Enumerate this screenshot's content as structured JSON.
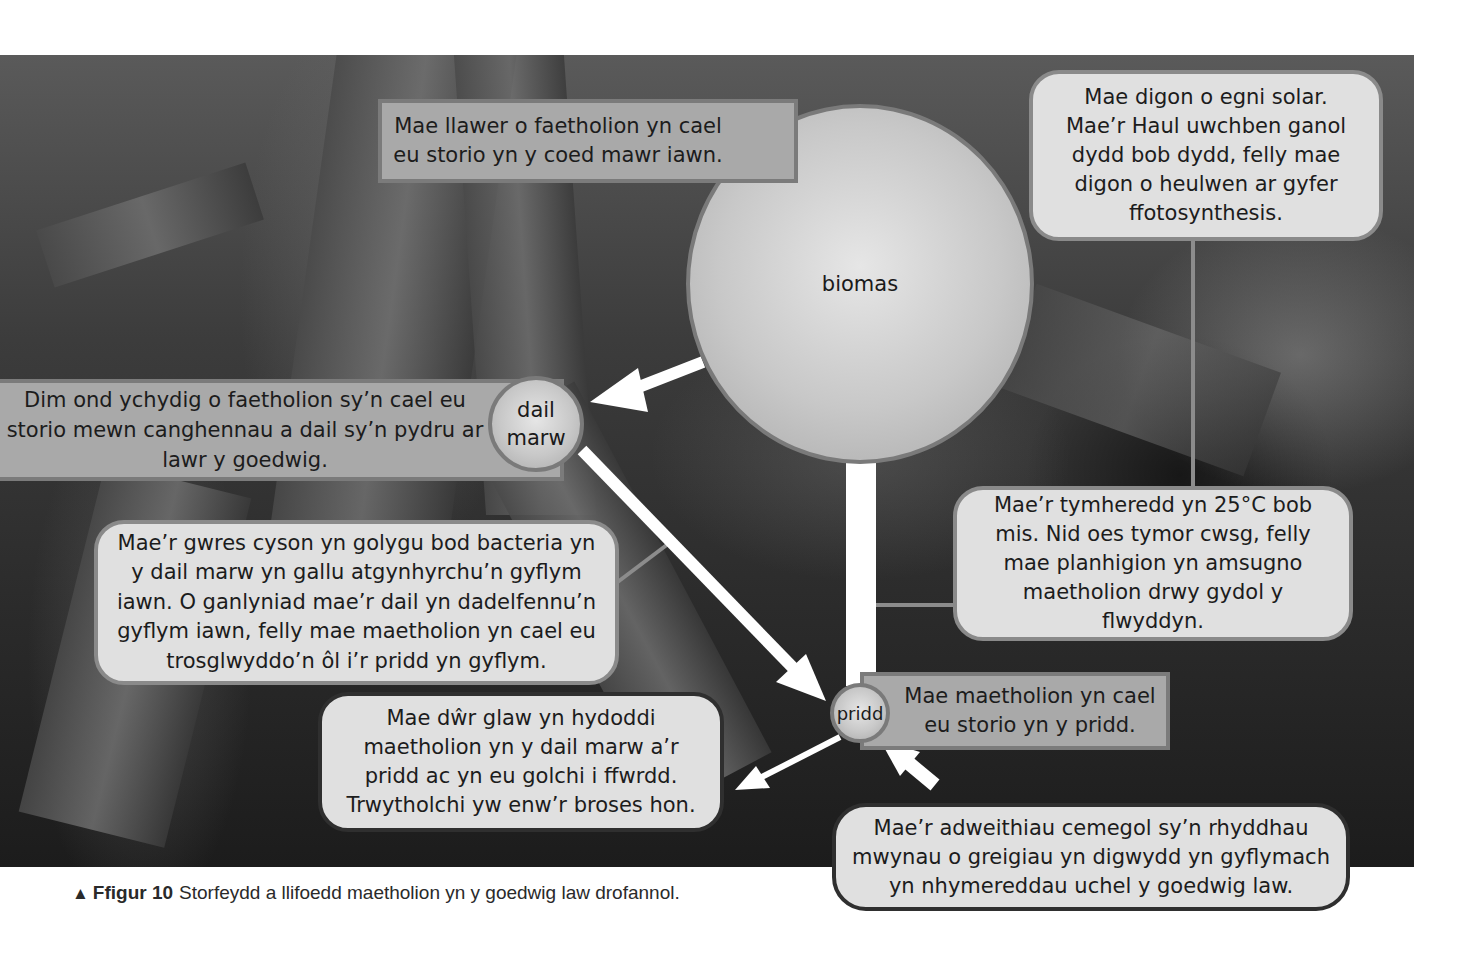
{
  "figure": {
    "caption_marker": "▲",
    "caption_label": "Ffigur 10",
    "caption_text": "Storfeydd a llifoedd maetholion yn y goedwig law drofannol."
  },
  "nodes": {
    "biomass": "biomas",
    "litter": "dail\nmarw",
    "soil": "pridd"
  },
  "boxes": {
    "biomass_store": "Mae llawer o faetholion yn cael\neu storio yn y coed mawr iawn.",
    "solar_energy": "Mae digon o egni solar.\nMae’r Haul uwchben ganol\ndydd bob dydd, felly mae\ndigon o heulwen ar gyfer\nffotosynthesis.",
    "litter_store": "Dim ond ychydig o faetholion sy’n cael eu\nstorio mewn canghennau a dail sy’n pydru ar\nlawr y goedwig.",
    "decomposition": "Mae’r gwres cyson yn golygu bod bacteria yn\ny dail marw yn gallu atgynhyrchu’n gyflym\niawn. O ganlyniad mae’r dail yn dadelfennu’n\ngyflym iawn, felly mae maetholion yn cael eu\ntrosglwyddo’n ôl i’r pridd yn gyflym.",
    "temperature": "Mae’r tymheredd yn 25°C bob\nmis. Nid oes tymor cwsg, felly\nmae planhigion yn amsugno\nmaetholion drwy gydol y\nflwyddyn.",
    "soil_store": "Mae maetholion yn cael\neu storio yn y pridd.",
    "leaching": "Mae dŵr glaw yn hydoddi\nmaetholion yn y dail marw a’r\npridd ac yn eu golchi i ffwrdd.\nTrwytholchi yw enw’r broses hon.",
    "weathering": "Mae’r adweithiau cemegol sy’n rhyddhau\nmwynau o greigiau yn digwydd yn gyflymach\nyn nhymereddau uchel y goedwig law."
  },
  "flows": [
    {
      "from": "biomas",
      "to": "dail marw",
      "label": "leaf fall"
    },
    {
      "from": "dail marw",
      "to": "pridd",
      "label": "decomposition"
    },
    {
      "from": "pridd",
      "to": "biomas",
      "label": "uptake"
    },
    {
      "from": "pridd",
      "to": "out",
      "label": "leaching"
    },
    {
      "from": "rock",
      "to": "pridd",
      "label": "weathering"
    }
  ],
  "colors": {
    "rect_box": "#a9a9a9",
    "round_box": "#e0e0e0",
    "arrow": "#ffffff",
    "node": "#c8c8c8"
  }
}
